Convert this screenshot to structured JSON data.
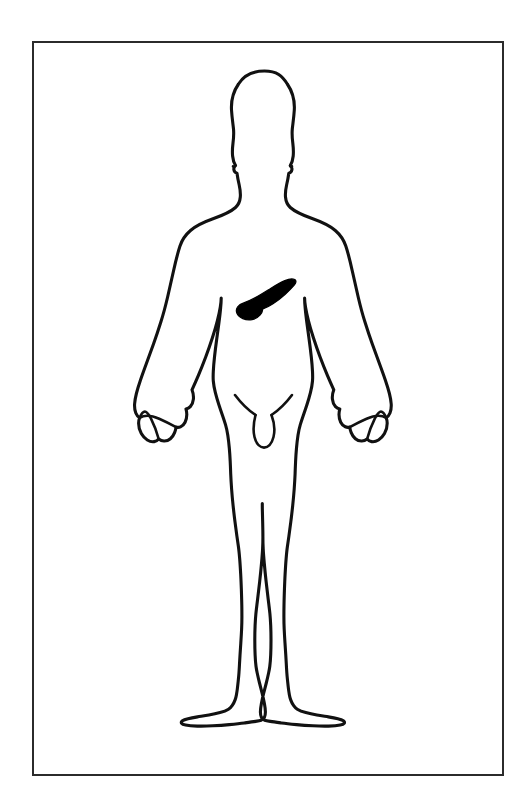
{
  "document": {
    "title": "Human Body Diagram with Highlighted Organ",
    "type": "anatomical-illustration",
    "view": "anterior",
    "subject": "adult male figure",
    "background_color": "#ffffff"
  },
  "frame": {
    "name": "illustration-border",
    "stroke_color": "#2b2b2b",
    "x": 33,
    "y": 42,
    "width": 470,
    "height": 733
  },
  "figure": {
    "outline_color": "#111111",
    "fill_color": "#ffffff",
    "pose": "standing, arms at sides, palms facing inward",
    "parts": [
      {
        "name": "head",
        "label": "Head"
      },
      {
        "name": "neck",
        "label": "Neck"
      },
      {
        "name": "shoulders",
        "label": "Shoulders"
      },
      {
        "name": "torso",
        "label": "Torso"
      },
      {
        "name": "left-arm",
        "label": "Left arm"
      },
      {
        "name": "right-arm",
        "label": "Right arm"
      },
      {
        "name": "left-hand",
        "label": "Left hand"
      },
      {
        "name": "right-hand",
        "label": "Right hand"
      },
      {
        "name": "groin",
        "label": "Groin"
      },
      {
        "name": "left-leg",
        "label": "Left leg"
      },
      {
        "name": "right-leg",
        "label": "Right leg"
      },
      {
        "name": "left-foot",
        "label": "Left foot"
      },
      {
        "name": "right-foot",
        "label": "Right foot"
      }
    ]
  },
  "highlighted_organ": {
    "name": "pancreas",
    "label": "Pancreas",
    "fill_color": "#000000",
    "shape": "elongated comma / tadpole form, tail to upper-right, bulbous head at lower-left",
    "location": "upper abdomen, slightly left of body midline, below the rib cage",
    "bounds": {
      "x": 238,
      "y": 278,
      "width": 58,
      "height": 44
    }
  },
  "caption": {
    "text": ""
  }
}
